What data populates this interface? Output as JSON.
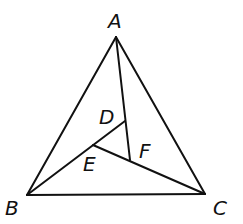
{
  "diagram": {
    "type": "triangle-with-interior-cevians",
    "stroke_color": "#111111",
    "background": "#ffffff",
    "points": {
      "A": {
        "label": "A",
        "x": 116,
        "y": 37,
        "label_x": 108,
        "label_y": 28
      },
      "B": {
        "label": "B",
        "x": 27,
        "y": 195,
        "label_x": 5,
        "label_y": 215
      },
      "C": {
        "label": "C",
        "x": 205,
        "y": 194,
        "label_x": 213,
        "label_y": 215
      },
      "D": {
        "label": "D",
        "x": 125,
        "y": 121,
        "label_x": 99,
        "label_y": 124
      },
      "E": {
        "label": "E",
        "x": 93,
        "y": 145,
        "label_x": 83,
        "label_y": 171
      },
      "F": {
        "label": "F",
        "x": 130,
        "y": 160,
        "label_x": 139,
        "label_y": 158
      }
    },
    "segments": [
      {
        "from": "A",
        "to": "B"
      },
      {
        "from": "A",
        "to": "C"
      },
      {
        "from": "B",
        "to": "C"
      },
      {
        "from": "A",
        "to": "F"
      },
      {
        "from": "B",
        "to": "D"
      },
      {
        "from": "E",
        "to": "C"
      }
    ]
  }
}
